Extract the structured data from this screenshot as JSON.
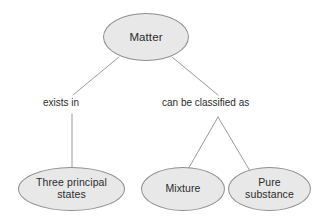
{
  "diagram": {
    "type": "concept-map",
    "title": "Matter",
    "background_color": "#ffffff",
    "node_fill_color": "#e8e8e8",
    "node_stroke_color": "#8f8f8f",
    "edge_stroke_color": "#9a9a9a",
    "text_color": "#2b2b2b",
    "nodes": [
      {
        "id": "matter",
        "label": "Matter"
      },
      {
        "id": "three_principal_states",
        "label": "Three principal\nstates"
      },
      {
        "id": "mixture",
        "label": "Mixture"
      },
      {
        "id": "pure_substance",
        "label": "Pure\nsubstance"
      }
    ],
    "edge_labels": [
      {
        "id": "exists_in",
        "label": "exists in"
      },
      {
        "id": "can_be_classified_as",
        "label": "can be classified as"
      }
    ]
  }
}
